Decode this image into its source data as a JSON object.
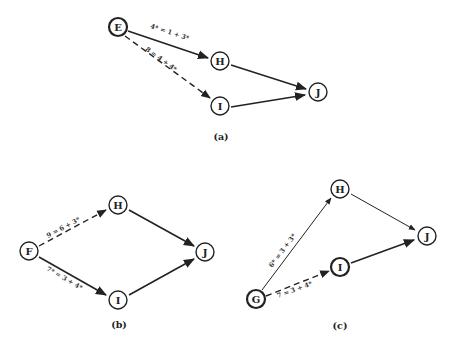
{
  "diagrams": [
    {
      "caption": "(a)",
      "nodes": [
        {
          "id": "E",
          "label": "E",
          "x": 118,
          "y": 27,
          "bold": true
        },
        {
          "id": "H",
          "label": "H",
          "x": 220,
          "y": 61
        },
        {
          "id": "I",
          "label": "I",
          "x": 220,
          "y": 106
        },
        {
          "id": "J",
          "label": "J",
          "x": 318,
          "y": 92
        }
      ],
      "edges": [
        {
          "from": "E",
          "to": "H",
          "style": "solid",
          "label": "4* = 1 + 3*"
        },
        {
          "from": "E",
          "to": "I",
          "style": "dashed",
          "label": "8 = 4 + 4*"
        },
        {
          "from": "H",
          "to": "J",
          "style": "solid",
          "label": ""
        },
        {
          "from": "I",
          "to": "J",
          "style": "solid",
          "label": ""
        }
      ]
    },
    {
      "caption": "(b)",
      "nodes": [
        {
          "id": "F",
          "label": "F",
          "x": 29,
          "y": 251
        },
        {
          "id": "H",
          "label": "H",
          "x": 118,
          "y": 205
        },
        {
          "id": "I",
          "label": "I",
          "x": 118,
          "y": 300
        },
        {
          "id": "J",
          "label": "J",
          "x": 205,
          "y": 252
        }
      ],
      "edges": [
        {
          "from": "F",
          "to": "H",
          "style": "dashed",
          "label": "9 = 6 + 3*"
        },
        {
          "from": "F",
          "to": "I",
          "style": "solid",
          "label": "7* = 3 + 4*"
        },
        {
          "from": "H",
          "to": "J",
          "style": "solid",
          "label": ""
        },
        {
          "from": "I",
          "to": "J",
          "style": "solid",
          "label": ""
        }
      ]
    },
    {
      "caption": "(c)",
      "nodes": [
        {
          "id": "G",
          "label": "G",
          "x": 256,
          "y": 299,
          "bold": true
        },
        {
          "id": "H",
          "label": "H",
          "x": 340,
          "y": 189
        },
        {
          "id": "I",
          "label": "I",
          "x": 340,
          "y": 267,
          "bold": true
        },
        {
          "id": "J",
          "label": "J",
          "x": 427,
          "y": 236
        }
      ],
      "edges": [
        {
          "from": "G",
          "to": "H",
          "style": "thin",
          "label": "6* = 3 + 3*"
        },
        {
          "from": "G",
          "to": "I",
          "style": "dashed",
          "label": "7 = 3 + 4*"
        },
        {
          "from": "H",
          "to": "J",
          "style": "thin",
          "label": ""
        },
        {
          "from": "I",
          "to": "J",
          "style": "solid",
          "label": ""
        }
      ]
    }
  ]
}
